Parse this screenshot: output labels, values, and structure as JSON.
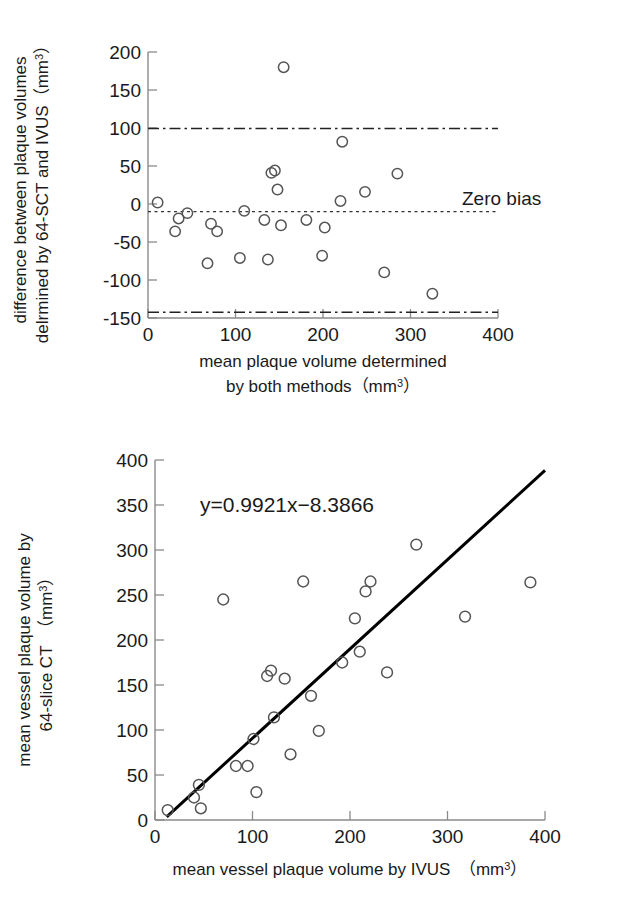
{
  "figure": {
    "panels": [
      {
        "id": "bland-altman",
        "annotation": "Zero bias"
      },
      {
        "id": "regression-scatter",
        "equation": "y=0.9921x−8.3866"
      }
    ]
  },
  "chart_data": [
    {
      "type": "scatter",
      "title": "",
      "xlabel": "mean plaque volume determined by both methods (mm3)",
      "xlabel_lines": [
        "mean plaque volume determined",
        "by both methods（mm"
      ],
      "xlabel_sup": "3",
      "xlabel_tail": "）",
      "ylabel": "difference between plaque volumes delrmined by 64-SCT and IVUS (mm3)",
      "ylabel_lines": [
        "difference between plaque volumes",
        "delrmined by 64-SCT and IVUS（mm"
      ],
      "ylabel_sup": "3",
      "ylabel_tail": "）",
      "xlim": [
        0,
        400
      ],
      "ylim": [
        -150,
        200
      ],
      "xticks": [
        0,
        100,
        200,
        300,
        400
      ],
      "yticks": [
        -150,
        -100,
        -50,
        0,
        50,
        100,
        150,
        200
      ],
      "grid": false,
      "legend": "none",
      "annotations": [
        {
          "text": "Zero bias",
          "x": 330,
          "y": 15
        }
      ],
      "reference_lines": [
        {
          "name": "upper-limit-of-agreement",
          "value": 110,
          "style": "dash-dot"
        },
        {
          "name": "zero-bias-line",
          "value": -10,
          "style": "dotted"
        },
        {
          "name": "lower-limit-of-agreement",
          "value": -132,
          "style": "dash-dot"
        }
      ],
      "points": [
        {
          "x": 11,
          "y": 2
        },
        {
          "x": 31,
          "y": -36
        },
        {
          "x": 35,
          "y": -19
        },
        {
          "x": 45,
          "y": -12
        },
        {
          "x": 68,
          "y": -78
        },
        {
          "x": 72,
          "y": -26
        },
        {
          "x": 79,
          "y": -36
        },
        {
          "x": 105,
          "y": -71
        },
        {
          "x": 110,
          "y": -9
        },
        {
          "x": 133,
          "y": -21
        },
        {
          "x": 137,
          "y": -73
        },
        {
          "x": 141,
          "y": 41
        },
        {
          "x": 145,
          "y": 44
        },
        {
          "x": 148,
          "y": 19
        },
        {
          "x": 152,
          "y": -28
        },
        {
          "x": 155,
          "y": 180
        },
        {
          "x": 181,
          "y": -21
        },
        {
          "x": 199,
          "y": -68
        },
        {
          "x": 202,
          "y": -31
        },
        {
          "x": 220,
          "y": 4
        },
        {
          "x": 222,
          "y": 82
        },
        {
          "x": 248,
          "y": 16
        },
        {
          "x": 270,
          "y": -90
        },
        {
          "x": 285,
          "y": 40
        },
        {
          "x": 325,
          "y": -118
        }
      ]
    },
    {
      "type": "scatter",
      "title": "",
      "xlabel": "mean vessel plaque volume by IVUS (mm3)",
      "xlabel_main": "mean vessel plaque volume by IVUS （mm",
      "xlabel_sup": "3",
      "xlabel_tail": "）",
      "ylabel": "mean vessel plaque volume by 64-slice CT (mm3)",
      "ylabel_lines": [
        "mean vessel plaque volume by",
        "64-slice CT （mm"
      ],
      "ylabel_sup": "3",
      "ylabel_tail": "）",
      "xlim": [
        0,
        400
      ],
      "ylim": [
        0,
        400
      ],
      "xticks": [
        0,
        100,
        200,
        300,
        400
      ],
      "yticks": [
        0,
        50,
        100,
        150,
        200,
        250,
        300,
        350,
        400
      ],
      "grid": false,
      "legend": "none",
      "annotations": [
        {
          "text": "y=0.9921x−8.3866",
          "x": 60,
          "y": 352
        }
      ],
      "fit_line": {
        "name": "regression-line",
        "slope": 0.9921,
        "intercept": -8.3866,
        "x_start": 12,
        "x_end": 400,
        "equation": "y=0.9921x−8.3866"
      },
      "points": [
        {
          "x": 13,
          "y": 11
        },
        {
          "x": 40,
          "y": 25
        },
        {
          "x": 45,
          "y": 39
        },
        {
          "x": 47,
          "y": 13
        },
        {
          "x": 70,
          "y": 245
        },
        {
          "x": 83,
          "y": 60
        },
        {
          "x": 95,
          "y": 60
        },
        {
          "x": 101,
          "y": 90
        },
        {
          "x": 104,
          "y": 31
        },
        {
          "x": 115,
          "y": 160
        },
        {
          "x": 119,
          "y": 166
        },
        {
          "x": 122,
          "y": 114
        },
        {
          "x": 133,
          "y": 157
        },
        {
          "x": 139,
          "y": 73
        },
        {
          "x": 152,
          "y": 265
        },
        {
          "x": 160,
          "y": 138
        },
        {
          "x": 168,
          "y": 99
        },
        {
          "x": 192,
          "y": 175
        },
        {
          "x": 205,
          "y": 224
        },
        {
          "x": 210,
          "y": 187
        },
        {
          "x": 216,
          "y": 254
        },
        {
          "x": 221,
          "y": 265
        },
        {
          "x": 238,
          "y": 164
        },
        {
          "x": 268,
          "y": 306
        },
        {
          "x": 318,
          "y": 226
        },
        {
          "x": 385,
          "y": 264
        }
      ]
    }
  ]
}
